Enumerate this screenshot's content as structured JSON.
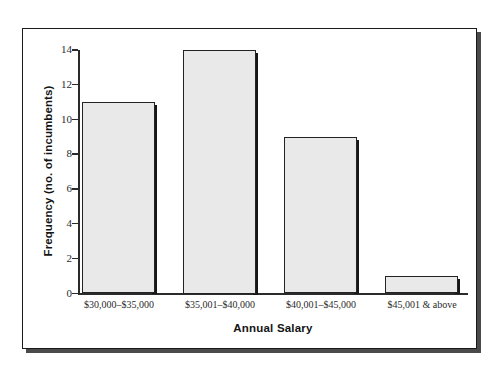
{
  "chart_data": {
    "type": "bar",
    "title": "",
    "xlabel": "Annual Salary",
    "ylabel": "Frequency (no. of incumbents)",
    "categories": [
      "$30,000–$35,000",
      "$35,001–$40,000",
      "$40,001–$45,000",
      "$45,001 & above"
    ],
    "values": [
      11,
      14,
      9,
      1
    ],
    "ylim": [
      0,
      14
    ],
    "yticks": [
      0,
      2,
      4,
      6,
      8,
      10,
      12,
      14
    ],
    "ytick_labels": [
      "0",
      "2",
      "4",
      "6",
      "8",
      "10",
      "12",
      "14"
    ],
    "grid": false,
    "legend": null,
    "legend_position": "none",
    "series": [
      {
        "name": "Frequency",
        "values": [
          11,
          14,
          9,
          1
        ]
      }
    ]
  },
  "style": {
    "bar_fill": "#e9e9e9",
    "bar_border": "#232323",
    "bar_shadow": "#161616",
    "axis_color": "#2b2b2b",
    "frame_color": "#1a1a1a",
    "frame_shadow": "#4a4a4a",
    "background": "#ffffff",
    "text_color": "#141414"
  }
}
